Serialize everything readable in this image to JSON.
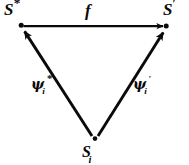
{
  "diagram": {
    "type": "commutative-triangle",
    "background_color": "#ffffff",
    "stroke_color": "#0a0a0a",
    "nodes": [
      {
        "id": "s-star",
        "label": "S*",
        "base": "S",
        "superscript": "*",
        "subscript": "",
        "position": {
          "x": 21,
          "y": 25
        }
      },
      {
        "id": "s-prime",
        "label": "S'",
        "base": "S",
        "superscript": "′",
        "subscript": "",
        "position": {
          "x": 166,
          "y": 26
        }
      },
      {
        "id": "s-i",
        "label": "Si",
        "base": "S",
        "superscript": "",
        "subscript": "i",
        "position": {
          "x": 95,
          "y": 139
        }
      }
    ],
    "edges": [
      {
        "id": "edge-f",
        "label": "f",
        "base": "f",
        "superscript": "",
        "subscript": "",
        "from": "s-star",
        "to": "s-prime",
        "arrowhead": "end"
      },
      {
        "id": "edge-psi-star",
        "label": "ψi*",
        "base": "ψ",
        "superscript": "*",
        "subscript": "i",
        "from": "s-i",
        "to": "s-star",
        "arrowhead": "end"
      },
      {
        "id": "edge-psi-prime",
        "label": "ψi′",
        "base": "ψ",
        "superscript": "′",
        "subscript": "i",
        "from": "s-i",
        "to": "s-prime",
        "arrowhead": "end"
      }
    ]
  }
}
